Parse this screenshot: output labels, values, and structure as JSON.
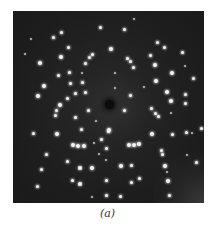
{
  "figure": {
    "caption": "(a)",
    "panel": {
      "left": 13,
      "top": 11,
      "width": 191,
      "height": 192,
      "background_color": "#1d1d1d",
      "spot_color": "#f4f4f4"
    },
    "beam_stop": {
      "x": 109,
      "y": 104
    },
    "spots": [
      [
        100,
        27,
        2
      ],
      [
        61,
        32,
        2
      ],
      [
        53,
        37,
        2
      ],
      [
        31,
        39,
        1
      ],
      [
        68,
        47,
        2
      ],
      [
        25,
        54,
        1
      ],
      [
        61,
        57,
        3
      ],
      [
        92,
        54,
        2
      ],
      [
        89,
        57,
        2
      ],
      [
        40,
        63,
        3
      ],
      [
        85,
        63,
        2
      ],
      [
        58,
        75,
        2
      ],
      [
        69,
        72,
        2
      ],
      [
        82,
        73,
        1
      ],
      [
        44,
        86,
        3
      ],
      [
        70,
        83,
        2
      ],
      [
        82,
        82,
        2
      ],
      [
        38,
        96,
        3
      ],
      [
        75,
        93,
        2
      ],
      [
        85,
        92,
        2
      ],
      [
        67,
        98,
        2
      ],
      [
        60,
        105,
        3
      ],
      [
        134,
        19,
        1
      ],
      [
        124,
        29,
        2
      ],
      [
        157,
        42,
        2
      ],
      [
        111,
        49,
        3
      ],
      [
        164,
        47,
        2
      ],
      [
        150,
        55,
        2
      ],
      [
        182,
        52,
        2
      ],
      [
        127,
        58,
        2
      ],
      [
        130,
        61,
        2
      ],
      [
        155,
        65,
        3
      ],
      [
        133,
        67,
        2
      ],
      [
        185,
        66,
        1
      ],
      [
        172,
        73,
        3
      ],
      [
        115,
        73,
        1
      ],
      [
        193,
        78,
        2
      ],
      [
        156,
        81,
        3
      ],
      [
        115,
        88,
        1
      ],
      [
        144,
        87,
        1
      ],
      [
        167,
        92,
        3
      ],
      [
        130,
        95,
        2
      ],
      [
        185,
        94,
        2
      ],
      [
        171,
        101,
        3
      ],
      [
        185,
        103,
        2
      ],
      [
        56,
        110,
        2
      ],
      [
        55,
        115,
        2
      ],
      [
        88,
        110,
        2
      ],
      [
        75,
        117,
        2
      ],
      [
        96,
        121,
        1
      ],
      [
        81,
        129,
        2
      ],
      [
        33,
        133,
        2
      ],
      [
        57,
        134,
        3
      ],
      [
        108,
        131,
        2
      ],
      [
        101,
        139,
        2
      ],
      [
        73,
        145,
        3
      ],
      [
        78,
        146,
        3
      ],
      [
        84,
        146,
        3
      ],
      [
        94,
        143,
        1
      ],
      [
        46,
        154,
        2
      ],
      [
        106,
        148,
        2
      ],
      [
        99,
        154,
        1
      ],
      [
        67,
        161,
        2
      ],
      [
        106,
        160,
        1
      ],
      [
        80,
        168,
        3
      ],
      [
        92,
        168,
        3
      ],
      [
        41,
        169,
        2
      ],
      [
        72,
        180,
        2
      ],
      [
        106,
        180,
        2
      ],
      [
        80,
        184,
        3
      ],
      [
        37,
        186,
        2
      ],
      [
        106,
        195,
        2
      ],
      [
        92,
        197,
        1
      ],
      [
        124,
        110,
        2
      ],
      [
        151,
        108,
        2
      ],
      [
        155,
        113,
        2
      ],
      [
        158,
        116,
        2
      ],
      [
        171,
        113,
        1
      ],
      [
        109,
        130,
        3
      ],
      [
        152,
        134,
        3
      ],
      [
        172,
        134,
        2
      ],
      [
        186,
        132,
        2
      ],
      [
        201,
        128,
        2
      ],
      [
        192,
        133,
        1
      ],
      [
        129,
        145,
        3
      ],
      [
        134,
        145,
        3
      ],
      [
        139,
        144,
        3
      ],
      [
        161,
        150,
        2
      ],
      [
        162,
        154,
        2
      ],
      [
        187,
        155,
        1
      ],
      [
        196,
        162,
        2
      ],
      [
        121,
        166,
        3
      ],
      [
        131,
        165,
        2
      ],
      [
        165,
        166,
        3
      ],
      [
        167,
        172,
        1
      ],
      [
        139,
        178,
        2
      ],
      [
        131,
        182,
        2
      ],
      [
        168,
        181,
        3
      ],
      [
        120,
        196,
        2
      ],
      [
        169,
        195,
        2
      ]
    ]
  }
}
